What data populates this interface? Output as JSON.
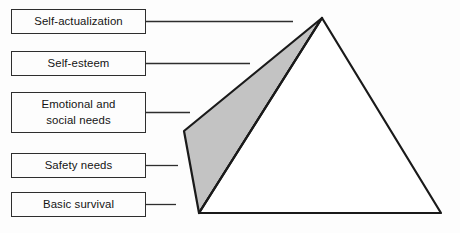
{
  "diagram": {
    "background_color": "#fdfdfd",
    "stroke_color": "#1a1a1a",
    "shade_color": "#c3c3c3",
    "face_color": "#ffffff",
    "levels": [
      {
        "id": "self-actualization",
        "label": "Self-actualization",
        "rank": 1,
        "connector_end_x": 293
      },
      {
        "id": "self-esteem",
        "label": "Self-esteem",
        "rank": 2,
        "connector_end_x": 250
      },
      {
        "id": "emotional-and-social-needs",
        "label": "Emotional and\nsocial needs",
        "rank": 3,
        "connector_end_x": 190
      },
      {
        "id": "safety-needs",
        "label": "Safety needs",
        "rank": 4,
        "connector_end_x": 178
      },
      {
        "id": "basic-survival",
        "label": "Basic survival",
        "rank": 5,
        "connector_end_x": 176
      }
    ],
    "pyramid": {
      "apex": [
        322,
        18
      ],
      "front_bottom_left": [
        199,
        213
      ],
      "bottom_right": [
        441,
        213
      ],
      "rear_left": [
        184,
        131
      ]
    }
  }
}
